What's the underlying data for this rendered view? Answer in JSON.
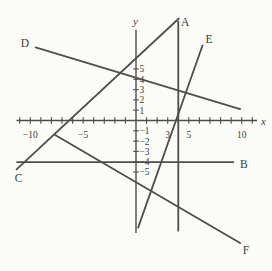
{
  "window": {
    "width": 272,
    "height": 271,
    "background": "#fbfbf8"
  },
  "colors": {
    "line": "#4e4e4e",
    "axis": "#4e4e4e",
    "text": "#3b3b3b"
  },
  "chart_data": {
    "type": "line",
    "title": "",
    "xlabel": "x",
    "ylabel": "y",
    "xlim": [
      -11.3,
      11.45
    ],
    "ylim": [
      -10.92,
      8.8
    ],
    "grid": false,
    "x_ticks": {
      "from": -11,
      "to": 11,
      "step": 1
    },
    "y_ticks": {
      "from": -5,
      "to": 5,
      "step": 1
    },
    "x_tick_labels": [
      {
        "value": -10,
        "text": "−10"
      },
      {
        "value": -5,
        "text": "−5"
      },
      {
        "value": 3,
        "text": "3"
      },
      {
        "value": 5,
        "text": "5"
      },
      {
        "value": 10,
        "text": "10"
      }
    ],
    "y_tick_labels": [
      {
        "value": 5,
        "text": "5"
      },
      {
        "value": 4,
        "text": "4"
      },
      {
        "value": 3,
        "text": "3"
      },
      {
        "value": 2,
        "text": "2"
      },
      {
        "value": 1,
        "text": "1"
      },
      {
        "value": -1,
        "text": "−1"
      },
      {
        "value": -2,
        "text": "−2"
      },
      {
        "value": -3,
        "text": "−3"
      },
      {
        "value": -4,
        "text": "−4"
      },
      {
        "value": -5,
        "text": "−5"
      }
    ],
    "axis_labels": {
      "x": {
        "text": "x",
        "pos": [
          12.05,
          -0.1
        ]
      },
      "y": {
        "text": "y",
        "pos": [
          -0.05,
          9.65
        ]
      }
    },
    "lines": [
      {
        "name": "A",
        "points": [
          [
            4.0,
            -10.7
          ],
          [
            4.0,
            9.6
          ]
        ],
        "label": {
          "text": "A",
          "pos": [
            4.65,
            9.6
          ]
        }
      },
      {
        "name": "B",
        "points": [
          [
            -11.25,
            -4.05
          ],
          [
            9.2,
            -4.05
          ]
        ],
        "label": {
          "text": "B",
          "pos": [
            10.2,
            -4.2
          ]
        }
      },
      {
        "name": "C",
        "points": [
          [
            -11.3,
            -4.75
          ],
          [
            4.05,
            9.9
          ]
        ],
        "label": {
          "text": "C",
          "pos": [
            -11.1,
            -5.55
          ]
        }
      },
      {
        "name": "D",
        "points": [
          [
            -9.5,
            7.1
          ],
          [
            9.85,
            1.1
          ]
        ],
        "label": {
          "text": "D",
          "pos": [
            -10.5,
            7.5
          ]
        }
      },
      {
        "name": "E",
        "points": [
          [
            0.2,
            -10.4
          ],
          [
            6.3,
            7.3
          ]
        ],
        "label": {
          "text": "E",
          "pos": [
            6.9,
            7.95
          ]
        }
      },
      {
        "name": "F",
        "points": [
          [
            -7.65,
            -1.4
          ],
          [
            9.85,
            -11.9
          ]
        ],
        "label": {
          "text": "F",
          "pos": [
            10.4,
            -12.6
          ]
        }
      }
    ]
  }
}
